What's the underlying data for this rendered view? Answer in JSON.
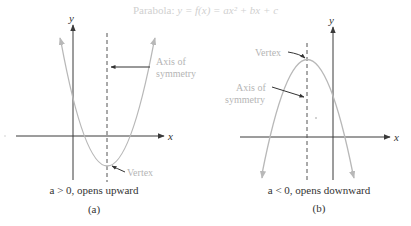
{
  "title": {
    "prefix": "Parabola: ",
    "equation": "y = f(x) = ax² + bx + c"
  },
  "colors": {
    "curve": "#b8b8b8",
    "axes": "#3a3a3a",
    "label_light": "#b5b5b5",
    "caption": "#333333",
    "title": "#cfcfcf"
  },
  "panels": [
    {
      "id": "a",
      "axis_x_label": "x",
      "axis_y_label": "y",
      "annotations": {
        "axis_of_symmetry_line1": "Axis of",
        "axis_of_symmetry_line2": "symmetry",
        "vertex": "Vertex"
      },
      "condition": "a > 0, opens upward",
      "sublabel": "(a)"
    },
    {
      "id": "b",
      "axis_x_label": "x",
      "axis_y_label": "y",
      "annotations": {
        "axis_of_symmetry_line1": "Axis of",
        "axis_of_symmetry_line2": "symmetry",
        "vertex": "Vertex"
      },
      "condition": "a < 0, opens downward",
      "sublabel": "(b)"
    }
  ]
}
